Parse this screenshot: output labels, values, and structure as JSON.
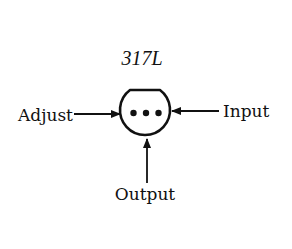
{
  "diagram": {
    "title": "317L",
    "component": "TO-92 style package, bottom view, three pins",
    "pins": [
      {
        "label": "Adjust",
        "side": "left"
      },
      {
        "label": "Input",
        "side": "right"
      },
      {
        "label": "Output",
        "side": "bottom"
      }
    ],
    "colors": {
      "ink": "#111111",
      "background": "#ffffff"
    }
  }
}
